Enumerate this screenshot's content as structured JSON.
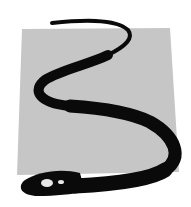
{
  "image": {
    "description": "Snake illustration over gray square",
    "colors": {
      "background": "#ffffff",
      "panel": "#c6c6c6",
      "snake": "#0a0a0a",
      "eye": "#e8e8e8"
    }
  }
}
